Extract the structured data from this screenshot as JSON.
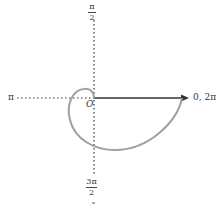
{
  "diagram": {
    "type": "polar-curve",
    "origin_label": "O",
    "axis_labels": {
      "right": "0, 2π",
      "left": "π",
      "top": {
        "numerator": "π",
        "denominator": "2"
      },
      "bottom": {
        "numerator": "3π",
        "denominator": "2"
      }
    },
    "colors": {
      "axis": "#333333",
      "curve": "#a0a0a0",
      "text": "#333333"
    }
  }
}
